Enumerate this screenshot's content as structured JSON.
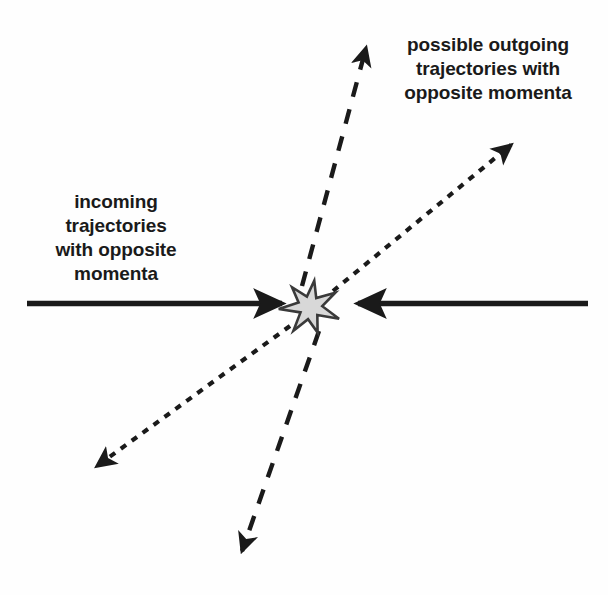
{
  "diagram": {
    "background_color": "#fefefe",
    "ink_color": "#1a1a1a",
    "star_fill_color": "#d8d8d8",
    "star_stroke_color": "#3a3a3a",
    "labels": {
      "outgoing": {
        "name": "possible outgoing trajectories with opposite momenta",
        "lines": [
          "possible outgoing",
          "trajectories with",
          "opposite momenta"
        ]
      },
      "incoming": {
        "name": "incoming trajectories with opposite momenta",
        "lines": [
          "incoming",
          "trajectories",
          "with opposite",
          "momenta"
        ]
      }
    },
    "collision_point": {
      "x": 310,
      "y": 307,
      "radius": 29,
      "points": 7
    },
    "arrows": [
      {
        "id": "incoming-left",
        "style": "solid",
        "direction": "right",
        "from": {
          "x": 27,
          "y": 303
        },
        "to": {
          "x": 288,
          "y": 303
        }
      },
      {
        "id": "incoming-right",
        "style": "solid",
        "direction": "left",
        "from": {
          "x": 588,
          "y": 303
        },
        "to": {
          "x": 352,
          "y": 303
        }
      },
      {
        "id": "outgoing-up",
        "style": "dashed",
        "direction": "up",
        "from": {
          "x": 302,
          "y": 284
        },
        "to": {
          "x": 366,
          "y": 42
        }
      },
      {
        "id": "outgoing-down",
        "style": "dashed",
        "direction": "down",
        "from": {
          "x": 318,
          "y": 332
        },
        "to": {
          "x": 241,
          "y": 557
        }
      },
      {
        "id": "outgoing-upper-right",
        "style": "dotted",
        "direction": "upper-right",
        "from": {
          "x": 334,
          "y": 290
        },
        "to": {
          "x": 516,
          "y": 140
        }
      },
      {
        "id": "outgoing-lower-left",
        "style": "dotted",
        "direction": "lower-left",
        "from": {
          "x": 289,
          "y": 327
        },
        "to": {
          "x": 91,
          "y": 470
        }
      }
    ]
  }
}
